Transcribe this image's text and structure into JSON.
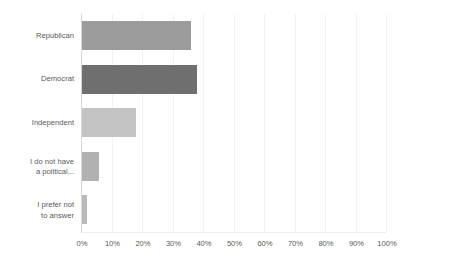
{
  "chart_data": {
    "type": "bar",
    "orientation": "horizontal",
    "title": "",
    "subtitle": "",
    "xlabel": "",
    "ylabel": "",
    "categories": [
      "Republican",
      "Democrat",
      "Independent",
      "I do not have\na political...",
      "I prefer not\nto answer"
    ],
    "values": [
      36,
      38,
      18,
      6,
      2
    ],
    "value_suffix": "%",
    "xlim": [
      0,
      100
    ],
    "xticks": [
      0,
      10,
      20,
      30,
      40,
      50,
      60,
      70,
      80,
      90,
      100
    ],
    "xtick_labels": [
      "0%",
      "10%",
      "20%",
      "30%",
      "40%",
      "50%",
      "60%",
      "70%",
      "80%",
      "90%",
      "100%"
    ],
    "grid": true,
    "grid_axis": "x",
    "legend": false,
    "legend_position": "none",
    "bar_colors": [
      "#9b9b9b",
      "#6f6f6f",
      "#c3c3c3",
      "#b1b1b1",
      "#b9b9b9"
    ],
    "colors": {
      "background": "#ffffff",
      "grid": "#f2f2f2",
      "axis": "#d9d9d9",
      "text": "#59595b"
    }
  }
}
